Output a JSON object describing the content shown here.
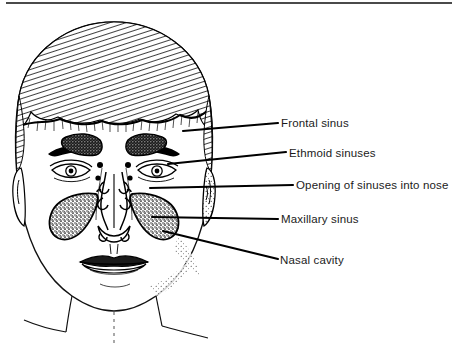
{
  "figure": {
    "style": "black and white stippled line engraving",
    "background_color": "#ffffff",
    "ink_color": "#000000",
    "rule_color": "#4a4a4a",
    "width": 452,
    "height": 347
  },
  "callouts": [
    {
      "id": "frontal-sinus",
      "label": "Frontal sinus",
      "text_x": 281,
      "text_y": 118,
      "leader": {
        "x1": 183,
        "y1": 131,
        "x2": 278,
        "y2": 123
      }
    },
    {
      "id": "ethmoid-sinuses",
      "label": "Ethmoid sinuses",
      "text_x": 289,
      "text_y": 148,
      "leader": {
        "x1": 168,
        "y1": 164,
        "x2": 286,
        "y2": 152
      }
    },
    {
      "id": "opening-of-sinuses-into-nose",
      "label": "Opening of sinuses into nose",
      "text_x": 296,
      "text_y": 180,
      "leader": {
        "x1": 150,
        "y1": 188,
        "x2": 293,
        "y2": 185
      }
    },
    {
      "id": "maxillary-sinus",
      "label": "Maxillary sinus",
      "text_x": 281,
      "text_y": 214,
      "leader": {
        "x1": 152,
        "y1": 217,
        "x2": 278,
        "y2": 219
      }
    },
    {
      "id": "nasal-cavity",
      "label": "Nasal cavity",
      "text_x": 280,
      "text_y": 255,
      "leader": {
        "x1": 163,
        "y1": 231,
        "x2": 278,
        "y2": 259
      }
    }
  ],
  "anatomy_regions": [
    {
      "id": "frontal-sinus-left",
      "name": "Frontal sinus (left)",
      "fill": "stipple-dark"
    },
    {
      "id": "frontal-sinus-right",
      "name": "Frontal sinus (right)",
      "fill": "stipple-dark"
    },
    {
      "id": "ethmoid-sinus-left",
      "name": "Ethmoid sinus (left)",
      "fill": "solid-dark"
    },
    {
      "id": "ethmoid-sinus-right",
      "name": "Ethmoid sinus (right)",
      "fill": "solid-dark"
    },
    {
      "id": "maxillary-sinus-left",
      "name": "Maxillary sinus (left)",
      "fill": "stipple-dark"
    },
    {
      "id": "maxillary-sinus-right",
      "name": "Maxillary sinus (right)",
      "fill": "stipple-dark"
    },
    {
      "id": "nasal-cavity-region",
      "name": "Nasal cavity",
      "fill": "outline"
    },
    {
      "id": "head-outline",
      "name": "Head and hair outline",
      "fill": "hatched"
    },
    {
      "id": "left-eye",
      "name": "Left eye",
      "fill": "outline"
    },
    {
      "id": "right-eye",
      "name": "Right eye",
      "fill": "outline"
    },
    {
      "id": "mouth",
      "name": "Mouth and lips",
      "fill": "outline"
    },
    {
      "id": "left-ear",
      "name": "Left ear",
      "fill": "outline"
    },
    {
      "id": "right-ear",
      "name": "Right ear",
      "fill": "outline"
    },
    {
      "id": "neck-shoulders",
      "name": "Neck and shoulders",
      "fill": "outline"
    }
  ]
}
